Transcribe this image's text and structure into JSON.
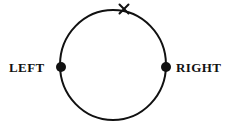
{
  "diagram": {
    "background_color": "#ffffff",
    "stroke_color": "#111111",
    "circle": {
      "center_x": 113,
      "center_y": 65,
      "radius_x": 53,
      "radius_y": 55,
      "stroke_width": 2,
      "fill": "none"
    },
    "points": [
      {
        "id": "left-point",
        "label": "LEFT",
        "x": 61,
        "y": 67,
        "radius": 5,
        "color": "#111111",
        "label_side": "left"
      },
      {
        "id": "right-point",
        "label": "RIGHT",
        "x": 166,
        "y": 67,
        "radius": 5,
        "color": "#111111",
        "label_side": "right"
      }
    ],
    "cross_mark": {
      "id": "top-cross",
      "symbol": "×",
      "x": 124,
      "y": 9,
      "size": 7,
      "stroke_width": 2,
      "color": "#111111"
    }
  }
}
